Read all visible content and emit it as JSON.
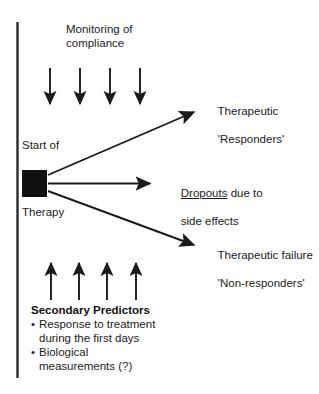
{
  "diagram": {
    "title_text": "Treatment course and outcome branches",
    "axis": {
      "name": "therapy-timeline-axis",
      "color": "#2b2b2b"
    },
    "top_section": {
      "label": "Monitoring of\ncompliance",
      "arrow_count": 4,
      "arrow_direction": "down"
    },
    "node": {
      "label_above": "Start of",
      "label_below": "Therapy",
      "color": "#101010",
      "shape": "filled-square"
    },
    "branches": [
      {
        "id": "responders",
        "direction": "up-right",
        "line1": "Therapeutic",
        "line2": "'Responders'"
      },
      {
        "id": "dropouts",
        "direction": "right",
        "emphasis_word": "Dropouts",
        "rest_line1": " due to",
        "line2": "side effects"
      },
      {
        "id": "non-responders",
        "direction": "down-right",
        "line1": "Therapeutic failure",
        "line2": "'Non-responders'"
      }
    ],
    "bottom_section": {
      "arrow_count": 4,
      "arrow_direction": "up",
      "title": "Secondary Predictors",
      "bullet_marker": "•",
      "bullets": [
        "Response to treatment\nduring the first days",
        "Biological\nmeasurements (?)"
      ]
    }
  }
}
